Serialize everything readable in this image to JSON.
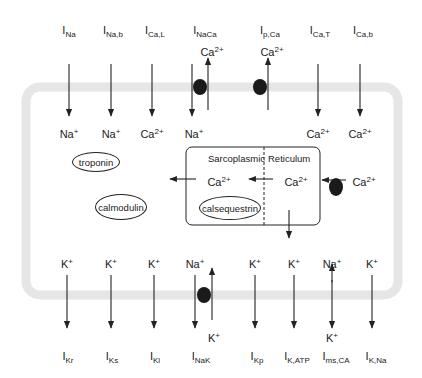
{
  "diagram": {
    "top_currents": [
      {
        "id": "ina",
        "main": "I",
        "sub": "Na",
        "ion": "Na",
        "charge": "+",
        "x": 66
      },
      {
        "id": "inab",
        "main": "I",
        "sub": "Na,b",
        "ion": "Na",
        "charge": "+",
        "x": 111
      },
      {
        "id": "ical",
        "main": "I",
        "sub": "Ca,L",
        "ion": "Ca",
        "charge": "2+",
        "x": 152
      },
      {
        "id": "inaca",
        "main": "I",
        "sub": "NaCa",
        "ion_in": "Na",
        "ion_in_charge": "+",
        "ion_out": "Ca",
        "ion_out_charge": "2+",
        "x": 198
      },
      {
        "id": "ipca",
        "main": "I",
        "sub": "p,Ca",
        "ion_out": "Ca",
        "ion_out_charge": "2+",
        "x": 266
      },
      {
        "id": "icat",
        "main": "I",
        "sub": "Ca,T",
        "ion": "Ca",
        "charge": "2+",
        "x": 318
      },
      {
        "id": "icab",
        "main": "I",
        "sub": "Ca,b",
        "ion": "Ca",
        "charge": "2+",
        "x": 360
      }
    ],
    "bottom_currents": [
      {
        "id": "ikr",
        "main": "I",
        "sub": "Kr",
        "ion": "K",
        "charge": "+",
        "x": 66
      },
      {
        "id": "iks",
        "main": "I",
        "sub": "Ks",
        "ion": "K",
        "charge": "+",
        "x": 111
      },
      {
        "id": "iki",
        "main": "I",
        "sub": "Kl",
        "ion": "K",
        "charge": "+",
        "x": 154
      },
      {
        "id": "inak",
        "main": "I",
        "sub": "NaK",
        "ion_out": "Na",
        "ion_out_charge": "+",
        "ion_in": "K",
        "ion_in_charge": "+",
        "x": 196
      },
      {
        "id": "ikp",
        "main": "I",
        "sub": "Kp",
        "ion": "K",
        "charge": "+",
        "x": 255
      },
      {
        "id": "ikatp",
        "main": "I",
        "sub": "K,ATP",
        "ion": "K",
        "charge": "+",
        "x": 294
      },
      {
        "id": "imsca",
        "main": "I",
        "sub": "ms,CA",
        "ion_top": "Na",
        "ion_top_charge": "+",
        "ion_bottom": "K",
        "ion_bottom_charge": "+",
        "x": 332
      },
      {
        "id": "ikna",
        "main": "I",
        "sub": "K,Na",
        "ion": "K",
        "charge": "+",
        "x": 372
      }
    ],
    "buffers": {
      "troponin": "troponin",
      "calmodulin": "calmodulin",
      "calsequestrin": "calsequestrin"
    },
    "sr": {
      "left_label": "Sarcoplasmic",
      "right_label": "Reticulum",
      "ca_jsr": "Ca",
      "ca_nsr": "Ca",
      "ca_cyto": "Ca",
      "charge": "2+"
    },
    "colors": {
      "membrane": "#e6e6e6",
      "line": "#222222",
      "pump": "#1a1a1a"
    }
  }
}
